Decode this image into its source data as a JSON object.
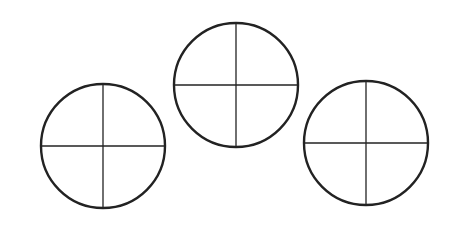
{
  "diagram": {
    "stroke_color": "#222222",
    "circles": [
      {
        "name": "left-circle",
        "cx": 103,
        "cy": 146,
        "r": 62
      },
      {
        "name": "middle-circle",
        "cx": 236,
        "cy": 85,
        "r": 62
      },
      {
        "name": "right-circle",
        "cx": 366,
        "cy": 143,
        "r": 62
      }
    ]
  }
}
